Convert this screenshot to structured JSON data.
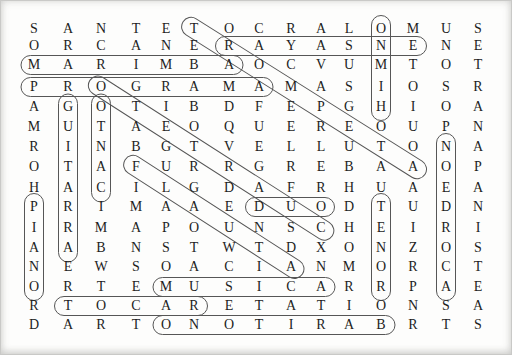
{
  "puzzle": {
    "type": "word-search",
    "grid_columns": 15,
    "grid_rows_count": 16,
    "grid_rows": [
      "SANTETOCRALOMUS",
      "ORCANERAYASNENE",
      "MARIMBAOCVUMTOT",
      "PROGRAMAMASIOSR",
      "AGOTIBDFEPGHIOA",
      "MUTAEOQUEREOUPN",
      "RINBGTVELLUTONA",
      "OTAFURRGREBAAOP",
      "HACILGDAFRHUAEA",
      "PRIMAAEDUODTUDN",
      "IRMAPOUNSCHEIRI",
      "AABNSTWTDXONZOS",
      "NEWSOACIANMORCT",
      "ORTEMUSICARRPAE",
      "RTOCARETATIONSA",
      "DARTONOTIRABRTS"
    ],
    "found_words": [
      {
        "word": "ENSAYAR",
        "direction": "horizontal-reversed",
        "start": {
          "row": 2,
          "col": 13
        },
        "end": {
          "row": 2,
          "col": 7
        }
      },
      {
        "word": "MARIMBA",
        "direction": "horizontal",
        "start": {
          "row": 3,
          "col": 1
        },
        "end": {
          "row": 3,
          "col": 7
        }
      },
      {
        "word": "PROGRAMA",
        "direction": "horizontal",
        "start": {
          "row": 4,
          "col": 1
        },
        "end": {
          "row": 4,
          "col": 8
        }
      },
      {
        "word": "DUO",
        "direction": "horizontal",
        "start": {
          "row": 10,
          "col": 8
        },
        "end": {
          "row": 10,
          "col": 10
        }
      },
      {
        "word": "MUSICA",
        "direction": "horizontal",
        "start": {
          "row": 14,
          "col": 5
        },
        "end": {
          "row": 14,
          "col": 10
        }
      },
      {
        "word": "TOCAR",
        "direction": "horizontal",
        "start": {
          "row": 15,
          "col": 2
        },
        "end": {
          "row": 15,
          "col": 6
        }
      },
      {
        "word": "BARITONO",
        "direction": "horizontal-reversed",
        "start": {
          "row": 16,
          "col": 12
        },
        "end": {
          "row": 16,
          "col": 5
        }
      },
      {
        "word": "PIANO",
        "direction": "vertical",
        "start": {
          "row": 10,
          "col": 1
        },
        "end": {
          "row": 14,
          "col": 1
        }
      },
      {
        "word": "GUITARRA",
        "direction": "vertical",
        "start": {
          "row": 5,
          "col": 2
        },
        "end": {
          "row": 12,
          "col": 2
        }
      },
      {
        "word": "CANTO",
        "direction": "vertical-reversed",
        "start": {
          "row": 9,
          "col": 3
        },
        "end": {
          "row": 5,
          "col": 3
        }
      },
      {
        "word": "HIMNO",
        "direction": "vertical-reversed",
        "start": {
          "row": 5,
          "col": 12
        },
        "end": {
          "row": 1,
          "col": 12
        }
      },
      {
        "word": "TENOR",
        "direction": "vertical",
        "start": {
          "row": 10,
          "col": 12
        },
        "end": {
          "row": 14,
          "col": 12
        }
      },
      {
        "word": "ACORDEON",
        "direction": "vertical-reversed",
        "start": {
          "row": 14,
          "col": 14
        },
        "end": {
          "row": 7,
          "col": 14
        }
      },
      {
        "word": "TROMPETA",
        "direction": "diagonal-down-right",
        "start": {
          "row": 1,
          "col": 6
        },
        "end": {
          "row": 8,
          "col": 13
        }
      },
      {
        "word": "CUARTETO",
        "direction": "diagonal-up-left",
        "start": {
          "row": 11,
          "col": 10
        },
        "end": {
          "row": 4,
          "col": 3
        }
      },
      {
        "word": "FLAUTA",
        "direction": "diagonal-down-right",
        "start": {
          "row": 8,
          "col": 4
        },
        "end": {
          "row": 13,
          "col": 9
        }
      }
    ],
    "colors": {
      "background": "#fdfdfc",
      "letter": "#1e1e1e",
      "oval_outline": "#565656",
      "page_edge": "#c9c9c7"
    }
  }
}
